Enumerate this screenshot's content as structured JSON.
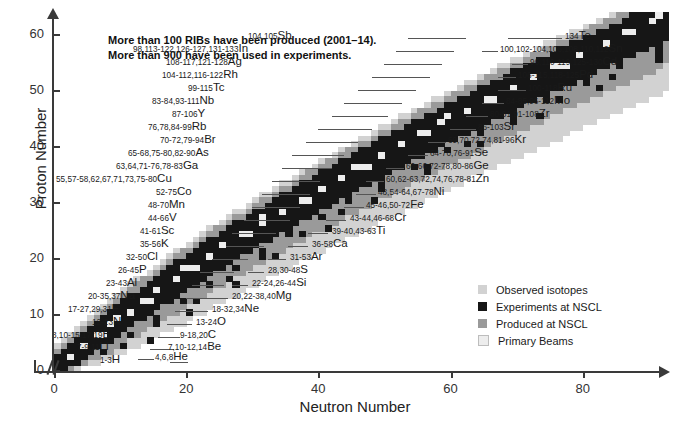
{
  "headline": {
    "line1": "More than 100 RIBs have been produced (2001–14).",
    "line2": "More than 900 have been used in experiments."
  },
  "axes": {
    "x": {
      "title": "Neutron Number",
      "ticks": [
        "0",
        "20",
        "40",
        "60",
        "80"
      ],
      "min": 0,
      "max": 92
    },
    "y": {
      "title": "Proton Number",
      "ticks": [
        "0",
        "10",
        "20",
        "30",
        "40",
        "50",
        "60"
      ],
      "min": 0,
      "max": 63
    }
  },
  "legend": {
    "items": [
      {
        "label": "Observed isotopes",
        "color": "#d2d2d2"
      },
      {
        "label": "Experiments at NSCL",
        "color": "#161616"
      },
      {
        "label": "Produced at NSCL",
        "color": "#9a9a9a"
      },
      {
        "label": "Primary Beams",
        "color": "#ededed"
      }
    ]
  },
  "chart_data": {
    "type": "scatter",
    "xlabel": "Neutron Number",
    "ylabel": "Proton Number",
    "xlim": [
      0,
      92
    ],
    "ylim": [
      0,
      63
    ],
    "grid": false,
    "legend_position": "middle-right",
    "categories_colors": {
      "observed": "#d2d2d2",
      "experiments": "#161616",
      "produced": "#9a9a9a",
      "primary_beams": "#ededed"
    },
    "annotations": [
      {
        "masses": "1-3",
        "symbol": "H",
        "z": 1,
        "label_x": 100,
        "label_y": 355,
        "leader_x": 170,
        "leader_w": 18
      },
      {
        "masses": "4,6,8",
        "symbol": "He",
        "z": 2,
        "label_x": 155,
        "label_y": 352,
        "leader_x": 138,
        "leader_w": 16,
        "side": "right"
      },
      {
        "masses": "7-9,11",
        "symbol": "Li",
        "z": 3,
        "label_x": 77,
        "label_y": 342,
        "leader_x": 152,
        "leader_w": 22
      },
      {
        "masses": "7,10-12,14",
        "symbol": "Be",
        "z": 4,
        "label_x": 168,
        "label_y": 342,
        "leader_x": 150,
        "leader_w": 14,
        "side": "right"
      },
      {
        "masses": "8,10-15,17,19",
        "symbol": "B",
        "z": 5,
        "label_x": 52,
        "label_y": 330,
        "leader_x": 158,
        "leader_w": 22
      },
      {
        "masses": "9-18,20",
        "symbol": "C",
        "z": 6,
        "label_x": 180,
        "label_y": 330,
        "leader_x": 160,
        "leader_w": 16,
        "side": "right"
      },
      {
        "masses": "12-23",
        "symbol": "N",
        "z": 7,
        "label_x": 92,
        "label_y": 317,
        "leader_x": 167,
        "leader_w": 24
      },
      {
        "masses": "13-24",
        "symbol": "O",
        "z": 8,
        "label_x": 196,
        "label_y": 317,
        "leader_x": 178,
        "leader_w": 14,
        "side": "right"
      },
      {
        "masses": "17-27,29,31",
        "symbol": "F",
        "z": 9,
        "label_x": 68,
        "label_y": 304,
        "leader_x": 175,
        "leader_w": 28
      },
      {
        "masses": "18-32,34",
        "symbol": "Ne",
        "z": 10,
        "label_x": 212,
        "label_y": 304,
        "leader_x": 192,
        "leader_w": 16,
        "side": "right"
      },
      {
        "masses": "20-35,37",
        "symbol": "Na",
        "z": 11,
        "label_x": 88,
        "label_y": 291,
        "leader_x": 186,
        "leader_w": 28
      },
      {
        "masses": "20,22-38,40",
        "symbol": "Mg",
        "z": 12,
        "label_x": 232,
        "label_y": 291,
        "leader_x": 212,
        "leader_w": 16,
        "side": "right"
      },
      {
        "masses": "23-43",
        "symbol": "Al",
        "z": 13,
        "label_x": 106,
        "label_y": 278,
        "leader_x": 192,
        "leader_w": 32
      },
      {
        "masses": "22-24,26-44",
        "symbol": "Si",
        "z": 14,
        "label_x": 252,
        "label_y": 278,
        "leader_x": 232,
        "leader_w": 16,
        "side": "right"
      },
      {
        "masses": "26-45",
        "symbol": "P",
        "z": 15,
        "label_x": 118,
        "label_y": 265,
        "leader_x": 200,
        "leader_w": 34
      },
      {
        "masses": "28,30-48",
        "symbol": "S",
        "z": 16,
        "label_x": 268,
        "label_y": 265,
        "leader_x": 248,
        "leader_w": 16,
        "side": "right"
      },
      {
        "masses": "32-50",
        "symbol": "Cl",
        "z": 17,
        "label_x": 126,
        "label_y": 252,
        "leader_x": 212,
        "leader_w": 36
      },
      {
        "masses": "31-53",
        "symbol": "Ar",
        "z": 18,
        "label_x": 290,
        "label_y": 252,
        "leader_x": 268,
        "leader_w": 18,
        "side": "right"
      },
      {
        "masses": "35-56",
        "symbol": "K",
        "z": 19,
        "label_x": 140,
        "label_y": 239,
        "leader_x": 226,
        "leader_w": 38
      },
      {
        "masses": "36-58",
        "symbol": "Ca",
        "z": 20,
        "label_x": 312,
        "label_y": 239,
        "leader_x": 288,
        "leader_w": 20,
        "side": "right"
      },
      {
        "masses": "41-61",
        "symbol": "Sc",
        "z": 21,
        "label_x": 140,
        "label_y": 226,
        "leader_x": 232,
        "leader_w": 44
      },
      {
        "masses": "39-40,43-63",
        "symbol": "Ti",
        "z": 22,
        "label_x": 332,
        "label_y": 226,
        "leader_x": 308,
        "leader_w": 20,
        "side": "right"
      },
      {
        "masses": "44-66",
        "symbol": "V",
        "z": 23,
        "label_x": 148,
        "label_y": 213,
        "leader_x": 244,
        "leader_w": 46
      },
      {
        "masses": "43-44,46-68",
        "symbol": "Cr",
        "z": 24,
        "label_x": 350,
        "label_y": 213,
        "leader_x": 326,
        "leader_w": 20,
        "side": "right"
      },
      {
        "masses": "48-70",
        "symbol": "Mn",
        "z": 25,
        "label_x": 148,
        "label_y": 200,
        "leader_x": 252,
        "leader_w": 48
      },
      {
        "masses": "45-46,50-72",
        "symbol": "Fe",
        "z": 26,
        "label_x": 366,
        "label_y": 200,
        "leader_x": 344,
        "leader_w": 20,
        "side": "right"
      },
      {
        "masses": "52-75",
        "symbol": "Co",
        "z": 27,
        "label_x": 156,
        "label_y": 187,
        "leader_x": 262,
        "leader_w": 48
      },
      {
        "masses": "48,54-64,67-78",
        "symbol": "Ni",
        "z": 28,
        "label_x": 378,
        "label_y": 187,
        "leader_x": 356,
        "leader_w": 20,
        "side": "right"
      },
      {
        "masses": "55,57-58,62,67,71,73,75-80",
        "symbol": "Cu",
        "z": 29,
        "label_x": 56,
        "label_y": 174,
        "leader_x": 272,
        "leader_w": 48
      },
      {
        "masses": "60,62-63,72,74,76,78-81",
        "symbol": "Zn",
        "z": 30,
        "label_x": 386,
        "label_y": 174,
        "leader_x": 366,
        "leader_w": 18,
        "side": "right"
      },
      {
        "masses": "63,64,71-76,78-83",
        "symbol": "Ga",
        "z": 31,
        "label_x": 116,
        "label_y": 161,
        "leader_x": 282,
        "leader_w": 50
      },
      {
        "masses": "60-66,72-78,80-86",
        "symbol": "Ge",
        "z": 32,
        "label_x": 406,
        "label_y": 161,
        "leader_x": 386,
        "leader_w": 18,
        "side": "right"
      },
      {
        "masses": "65-68,75-80,82-90",
        "symbol": "As",
        "z": 33,
        "label_x": 128,
        "label_y": 148,
        "leader_x": 292,
        "leader_w": 52
      },
      {
        "masses": "64-70,76-91",
        "symbol": "Se",
        "z": 34,
        "label_x": 430,
        "label_y": 148,
        "leader_x": 408,
        "leader_w": 20,
        "side": "right"
      },
      {
        "masses": "70-72,79-94",
        "symbol": "Br",
        "z": 35,
        "label_x": 160,
        "label_y": 135,
        "leader_x": 306,
        "leader_w": 52
      },
      {
        "masses": "69,70,72,74,81-96",
        "symbol": "Kr",
        "z": 36,
        "label_x": 448,
        "label_y": 135,
        "leader_x": 428,
        "leader_w": 18,
        "side": "right"
      },
      {
        "masses": "76,78,84-99",
        "symbol": "Rb",
        "z": 37,
        "label_x": 148,
        "label_y": 122,
        "leader_x": 318,
        "leader_w": 54
      },
      {
        "masses": "86-103",
        "symbol": "Sr",
        "z": 38,
        "label_x": 478,
        "label_y": 122,
        "leader_x": 450,
        "leader_w": 26,
        "side": "right"
      },
      {
        "masses": "87-106",
        "symbol": "Y",
        "z": 39,
        "label_x": 172,
        "label_y": 109,
        "leader_x": 332,
        "leader_w": 56
      },
      {
        "masses": "80-81,91-108",
        "symbol": "Zr",
        "z": 40,
        "label_x": 490,
        "label_y": 109,
        "leader_x": 466,
        "leader_w": 22,
        "side": "right"
      },
      {
        "masses": "83-84,93-111",
        "symbol": "Nb",
        "z": 41,
        "label_x": 152,
        "label_y": 96,
        "leader_x": 344,
        "leader_w": 58
      },
      {
        "masses": "84-85,96-112",
        "symbol": "Mo",
        "z": 42,
        "label_x": 506,
        "label_y": 96,
        "leader_x": 482,
        "leader_w": 22,
        "side": "right"
      },
      {
        "masses": "99-115",
        "symbol": "Tc",
        "z": 43,
        "label_x": 188,
        "label_y": 83,
        "leader_x": 358,
        "leader_w": 58
      },
      {
        "masses": "100-118",
        "symbol": "Ru",
        "z": 44,
        "label_x": 528,
        "label_y": 83,
        "leader_x": 498,
        "leader_w": 28,
        "side": "right"
      },
      {
        "masses": "104-112,116-122",
        "symbol": "Rh",
        "z": 45,
        "label_x": 162,
        "label_y": 70,
        "leader_x": 372,
        "leader_w": 58
      },
      {
        "masses": "106-115,118-125",
        "symbol": "Pd",
        "z": 46,
        "label_x": 518,
        "label_y": 70,
        "leader_x": 498,
        "leader_w": 18,
        "side": "right"
      },
      {
        "masses": "108-117,121-128",
        "symbol": "Ag",
        "z": 47,
        "label_x": 166,
        "label_y": 57,
        "leader_x": 384,
        "leader_w": 58
      },
      {
        "masses": "96,110-119,125-130",
        "symbol": "Cd",
        "z": 48,
        "label_x": 530,
        "label_y": 57,
        "leader_x": 512,
        "leader_w": 16,
        "side": "right"
      },
      {
        "masses": "98,113-122,126-127,131-133",
        "symbol": "In",
        "z": 49,
        "label_x": 133,
        "label_y": 44,
        "leader_x": 396,
        "leader_w": 58
      },
      {
        "masses": "100,102-104,106,108,110,112",
        "symbol": "Sn",
        "z": 50,
        "label_x": 500,
        "label_y": 44,
        "leader_x": 482,
        "leader_w": 16,
        "side": "right"
      },
      {
        "masses": "104,105",
        "symbol": "Sb",
        "z": 51,
        "label_x": 248,
        "label_y": 31,
        "leader_x": 408,
        "leader_w": 58
      },
      {
        "masses": "134",
        "symbol": "Te",
        "z": 52,
        "label_x": 565,
        "label_y": 31,
        "leader_x": 508,
        "leader_w": 54,
        "side": "right"
      }
    ]
  }
}
